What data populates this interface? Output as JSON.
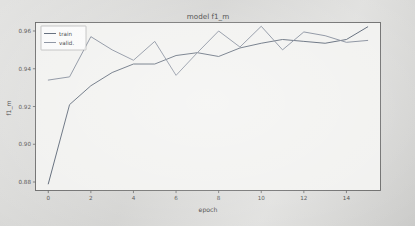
{
  "figure": {
    "title": "model f1_m",
    "xlabel": "epoch",
    "ylabel": "f1_m"
  },
  "legend": {
    "position": "upper-left",
    "entries": [
      {
        "label": "train",
        "color": "#4e5a6a"
      },
      {
        "label": "valid.",
        "color": "#7b8494"
      }
    ]
  },
  "axes": {
    "x_ticks": [
      "0",
      "2",
      "4",
      "6",
      "8",
      "10",
      "12",
      "14"
    ],
    "y_ticks": [
      "0.88",
      "0.90",
      "0.92",
      "0.94",
      "0.96"
    ]
  },
  "chart_data": {
    "type": "line",
    "title": "model f1_m",
    "xlabel": "epoch",
    "ylabel": "f1_m",
    "xlim": [
      -0.6,
      15.6
    ],
    "ylim": [
      0.8755,
      0.9645
    ],
    "grid": false,
    "legend_position": "upper left",
    "x": [
      0,
      1,
      2,
      3,
      4,
      5,
      6,
      7,
      8,
      9,
      10,
      11,
      12,
      13,
      14,
      15
    ],
    "xticks": [
      0,
      2,
      4,
      6,
      8,
      10,
      12,
      14
    ],
    "yticks": [
      0.88,
      0.9,
      0.92,
      0.94,
      0.96
    ],
    "series": [
      {
        "name": "train",
        "color": "#4e5a6a",
        "values": [
          0.879,
          0.921,
          0.931,
          0.938,
          0.9425,
          0.9425,
          0.947,
          0.9485,
          0.9465,
          0.951,
          0.9535,
          0.9555,
          0.9545,
          0.9535,
          0.9555,
          0.9622
        ]
      },
      {
        "name": "valid.",
        "color": "#7b8494",
        "values": [
          0.934,
          0.9357,
          0.957,
          0.95,
          0.9445,
          0.9545,
          0.9365,
          0.9485,
          0.96,
          0.9515,
          0.9625,
          0.95,
          0.9595,
          0.9575,
          0.954,
          0.955
        ]
      }
    ]
  }
}
